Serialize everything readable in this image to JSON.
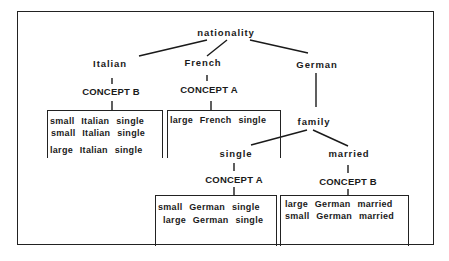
{
  "diagram": {
    "type": "decision-tree",
    "root": {
      "label": "nationality",
      "children": [
        {
          "label": "Italian",
          "concept": "CONCEPT B",
          "instances": [
            "small  Italian  single",
            "small  Italian  single",
            "large  Italian  single"
          ]
        },
        {
          "label": "French",
          "concept": "CONCEPT A",
          "instances": [
            "large  French  single"
          ]
        },
        {
          "label": "German",
          "child": {
            "label": "family",
            "children": [
              {
                "label": "single",
                "concept": "CONCEPT A",
                "instances": [
                  "small  German  single",
                  "large  German  single"
                ]
              },
              {
                "label": "married",
                "concept": "CONCEPT B",
                "instances": [
                  "large  German  married",
                  "small  German  married"
                ]
              }
            ]
          }
        }
      ]
    }
  },
  "labels": {
    "root": "nationality",
    "italian": "Italian",
    "french": "French",
    "german": "German",
    "family": "family",
    "single": "single",
    "married": "married",
    "italian_concept": "CONCEPT B",
    "french_concept": "CONCEPT A",
    "single_concept": "CONCEPT A",
    "married_concept": "CONCEPT B"
  },
  "instances": {
    "italian": [
      "small  Italian  single",
      "small  Italian  single",
      "large  Italian  single"
    ],
    "french": [
      "large  French  single"
    ],
    "german_single": [
      "small  German  single",
      "large  German  single"
    ],
    "german_married": [
      "large  German  married",
      "small  German  married"
    ]
  },
  "colors": {
    "ink": "#1a1a1a",
    "background": "#ffffff"
  }
}
